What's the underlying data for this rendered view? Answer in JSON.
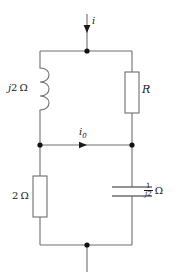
{
  "diagram": {
    "stroke_color": "#6e6e6e",
    "node_color": "#111111",
    "text_color": "#1a1a1a"
  },
  "labels": {
    "source_current": "i",
    "branch_current": "i",
    "branch_current_sub": "0",
    "inductor": "j2 Ω",
    "inductor_j": "j",
    "inductor_value": "2",
    "inductor_unit": "Ω",
    "resistor_r": "R",
    "resistor_2ohm": "2 Ω",
    "resistor_2ohm_value": "2",
    "resistor_2ohm_unit": "Ω",
    "capacitor_numerator": "1",
    "capacitor_denominator": "j2",
    "capacitor_unit": "Ω"
  },
  "components": [
    {
      "name": "inductor-j2-ohm",
      "type": "inductor",
      "label": "j2 Ω",
      "branch": "left-upper"
    },
    {
      "name": "resistor-r",
      "type": "resistor",
      "label": "R",
      "branch": "right-upper"
    },
    {
      "name": "resistor-2-ohm",
      "type": "resistor",
      "label": "2 Ω",
      "branch": "left-lower"
    },
    {
      "name": "capacitor-1-over-j2",
      "type": "capacitor",
      "label": "1/j2 Ω",
      "branch": "right-lower"
    }
  ],
  "nodes": [
    {
      "name": "top-node",
      "x": 87,
      "y": 51
    },
    {
      "name": "mid-left-node",
      "x": 40,
      "y": 145
    },
    {
      "name": "mid-right-node",
      "x": 132,
      "y": 145
    },
    {
      "name": "bottom-node",
      "x": 87,
      "y": 245
    }
  ],
  "currents": [
    {
      "name": "source-current-i",
      "label": "i",
      "direction": "down",
      "at": "top-lead"
    },
    {
      "name": "branch-current-i0",
      "label": "i0",
      "direction": "right",
      "at": "middle-wire"
    }
  ]
}
